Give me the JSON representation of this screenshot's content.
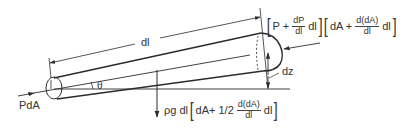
{
  "diagram": {
    "type": "free-body diagram of inclined tapered fluid element",
    "labels": {
      "length": "dl",
      "angle": "θ",
      "inlet_force": "PdA",
      "height": "dz"
    },
    "outlet_force": {
      "open1": "[",
      "term1": "P +",
      "frac1_num": "dP",
      "frac1_den": "dl",
      "term1b": "dl",
      "close1": "]",
      "open2": "[",
      "term2": "dA +",
      "frac2_num": "d(dA)",
      "frac2_den": "dl",
      "term2b": "dl",
      "close2": "]"
    },
    "weight_force": {
      "prefix": "ρg dl",
      "open": "[",
      "term": "dA+ 1/2",
      "frac_num": "d(dA)",
      "frac_den": "dl",
      "termb": "dl",
      "close": "]"
    },
    "colors": {
      "line": "#2b2b2b",
      "background": "#ffffff"
    }
  }
}
